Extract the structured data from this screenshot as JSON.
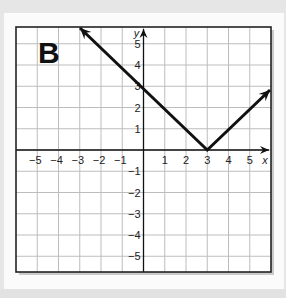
{
  "panel": {
    "label": "B"
  },
  "chart_data": {
    "type": "line",
    "title": "",
    "panel_label": "B",
    "xlabel": "x",
    "ylabel": "y",
    "xlim": [
      -6,
      6
    ],
    "ylim": [
      -5.75,
      5.8
    ],
    "grid": true,
    "x_ticks": [
      "-5",
      "-4",
      "-3",
      "-2",
      "-1",
      "1",
      "2",
      "3",
      "4",
      "5"
    ],
    "y_ticks": [
      "5",
      "4",
      "3",
      "2",
      "1",
      "-1",
      "-2",
      "-3",
      "-4",
      "-5"
    ],
    "series": [
      {
        "name": "y = |x - 3|",
        "x": [
          -2.9,
          3,
          6
        ],
        "y": [
          5.8,
          0,
          3
        ],
        "arrows": "both ends"
      }
    ],
    "vertex": [
      3,
      0
    ],
    "y_intercept": 3
  },
  "colors": {
    "line": "#111111",
    "grid": "#bdbdbd",
    "frame": "#222222",
    "background": "#fbfbfb"
  }
}
